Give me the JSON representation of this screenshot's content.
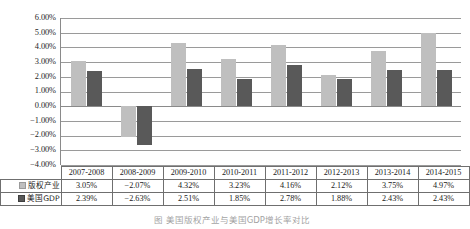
{
  "chart_data": {
    "type": "bar",
    "title": "",
    "xlabel": "",
    "ylabel": "",
    "ylim": [
      -4,
      6
    ],
    "ytick_step": 1,
    "ytick_labels": [
      "6.00%",
      "5.00%",
      "4.00%",
      "3.00%",
      "2.00%",
      "1.00%",
      "0.00%",
      "−1.00%",
      "−2.00%",
      "−3.00%",
      "−4.00%"
    ],
    "grid": true,
    "legend_position": "table-row-headers",
    "categories": [
      "2007-2008",
      "2008-2009",
      "2009-2010",
      "2010-2011",
      "2011-2012",
      "2012-2013",
      "2013-2014",
      "2014-2015"
    ],
    "series": [
      {
        "name": "版权产业",
        "color": "#bfbfbf",
        "values": [
          3.05,
          -2.07,
          4.32,
          3.23,
          4.16,
          2.12,
          3.75,
          4.97
        ],
        "labels": [
          "3.05%",
          "−2.07%",
          "4.32%",
          "3.23%",
          "4.16%",
          "2.12%",
          "3.75%",
          "4.97%"
        ]
      },
      {
        "name": "美国GDP",
        "color": "#595959",
        "values": [
          2.39,
          -2.63,
          2.51,
          1.85,
          2.78,
          1.88,
          2.43,
          2.43
        ],
        "labels": [
          "2.39%",
          "−2.63%",
          "2.51%",
          "1.85%",
          "2.78%",
          "1.88%",
          "2.43%",
          "2.43%"
        ]
      }
    ]
  },
  "table": {
    "corner_label": "",
    "header": [
      "2007-2008",
      "2008-2009",
      "2009-2010",
      "2010-2011",
      "2011-2012",
      "2012-2013",
      "2013-2014",
      "2014-2015"
    ],
    "rows": [
      {
        "label": "版权产业",
        "swatch": "series-0-swatch",
        "cells": [
          "3.05%",
          "−2.07%",
          "4.32%",
          "3.23%",
          "4.16%",
          "2.12%",
          "3.75%",
          "4.97%"
        ]
      },
      {
        "label": "美国GDP",
        "swatch": "series-1-swatch",
        "cells": [
          "2.39%",
          "−2.63%",
          "2.51%",
          "1.85%",
          "2.78%",
          "1.88%",
          "2.43%",
          "2.43%"
        ]
      }
    ]
  },
  "caption": {
    "text": "图  美国版权产业与美国GDP增长率对比"
  },
  "colors": {
    "series_0": "#bfbfbf",
    "series_1": "#595959",
    "gridline": "#9a9a9a",
    "axis": "#8a8a8a",
    "table_border": "#6f6f6f",
    "text": "#1a1a1a"
  }
}
